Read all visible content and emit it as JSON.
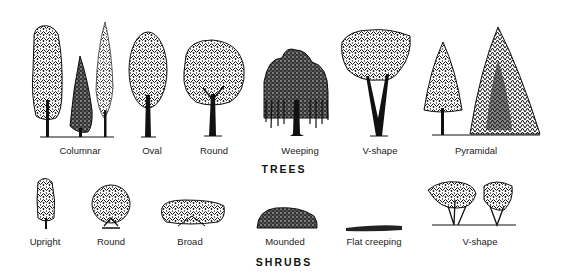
{
  "figure": {
    "sections": [
      {
        "heading": "TREES",
        "forms": [
          {
            "label": "Columnar",
            "icon": "columnar-tree-icon"
          },
          {
            "label": "Oval",
            "icon": "oval-tree-icon"
          },
          {
            "label": "Round",
            "icon": "round-tree-icon"
          },
          {
            "label": "Weeping",
            "icon": "weeping-tree-icon"
          },
          {
            "label": "V-shape",
            "icon": "v-shape-tree-icon"
          },
          {
            "label": "Pyramidal",
            "icon": "pyramidal-tree-icon"
          }
        ]
      },
      {
        "heading": "SHRUBS",
        "forms": [
          {
            "label": "Upright",
            "icon": "upright-shrub-icon"
          },
          {
            "label": "Round",
            "icon": "round-shrub-icon"
          },
          {
            "label": "Broad",
            "icon": "broad-shrub-icon"
          },
          {
            "label": "Mounded",
            "icon": "mounded-shrub-icon"
          },
          {
            "label": "Flat creeping",
            "icon": "flat-creeping-shrub-icon"
          },
          {
            "label": "V-shape",
            "icon": "v-shape-shrub-icon"
          }
        ]
      }
    ]
  }
}
